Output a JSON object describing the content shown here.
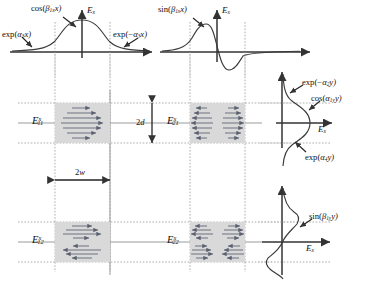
{
  "figure": {
    "type": "waveguide-mode-field-diagram",
    "core_fill": "#d9d9d9",
    "curve_color": "#2b2b2b",
    "guide_color": "#8c8c8c",
    "arrow_color": "#5a6070"
  },
  "top_left_plot": {
    "name": "x-profile-fundamental",
    "axis_label": "E",
    "axis_sub": "x",
    "center_label": "cos(β",
    "labels": {
      "left_decay": {
        "fn": "exp(",
        "arg": "α",
        "sub": "3",
        "var": "x)"
      },
      "center": {
        "fn": "cos(",
        "arg": "β",
        "sub": "1x",
        "var": "x)"
      },
      "right_decay": {
        "fn": "exp(−",
        "arg": "α",
        "sub": "3",
        "var": "x)"
      }
    },
    "profile": "even-cosine-core-exponential-cladding"
  },
  "top_right_plot": {
    "name": "x-profile-second-order",
    "axis_label": "E",
    "axis_sub": "x",
    "labels": {
      "center": {
        "fn": "sin(",
        "arg": "β",
        "sub": "1x",
        "var": "x)"
      }
    },
    "profile": "odd-sine-core-exponential-cladding"
  },
  "right_upper_plot": {
    "name": "y-profile-fundamental",
    "axis_label": "E",
    "axis_sub": "x",
    "labels": {
      "top_decay": {
        "fn": "exp(−",
        "arg": "α",
        "sub": "2",
        "var": "y)"
      },
      "center": {
        "fn": "cos(",
        "arg": "α",
        "sub": "1y",
        "var": "y)"
      },
      "bottom_decay": {
        "fn": "exp(",
        "arg": "α",
        "sub": "4",
        "var": "y)"
      }
    },
    "profile": "even-cosine-core-exponential-cladding"
  },
  "right_lower_plot": {
    "name": "y-profile-second-order",
    "axis_label": "E",
    "axis_sub": "x",
    "labels": {
      "center": {
        "fn": "sin(",
        "arg": "β",
        "sub": "1y",
        "var": "y)"
      }
    },
    "profile": "odd-sine-core-exponential-cladding"
  },
  "modes": [
    {
      "base": "E",
      "sup": "x",
      "sub": "11",
      "lobes_x": 1,
      "lobes_y": 1,
      "cell": "top-left"
    },
    {
      "base": "E",
      "sup": "x",
      "sub": "21",
      "lobes_x": 2,
      "lobes_y": 1,
      "cell": "top-right"
    },
    {
      "base": "E",
      "sup": "x",
      "sub": "12",
      "lobes_x": 1,
      "lobes_y": 2,
      "cell": "bottom-left"
    },
    {
      "base": "E",
      "sup": "x",
      "sub": "22",
      "lobes_x": 2,
      "lobes_y": 2,
      "cell": "bottom-right"
    }
  ],
  "dimensions": [
    {
      "name": "width",
      "label_num": "2",
      "label_var": "w",
      "orientation": "horizontal"
    },
    {
      "name": "height",
      "label_num": "2",
      "label_var": "d",
      "orientation": "vertical"
    }
  ]
}
